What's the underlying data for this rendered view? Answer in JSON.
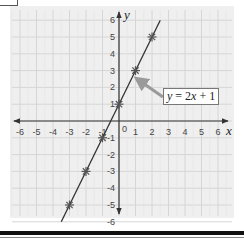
{
  "chart_data": {
    "type": "line",
    "title": "",
    "equation_label": "y = 2x + 1",
    "xlabel": "x",
    "ylabel": "y",
    "xlim": [
      -6,
      6
    ],
    "ylim": [
      -6,
      6
    ],
    "x_ticks": [
      -6,
      -5,
      -4,
      -3,
      -2,
      -1,
      0,
      1,
      2,
      3,
      4,
      5,
      6
    ],
    "y_ticks": [
      -6,
      -5,
      -4,
      -3,
      -2,
      -1,
      1,
      2,
      3,
      4,
      5,
      6
    ],
    "origin_label": "0",
    "grid": true,
    "series": [
      {
        "name": "y = 2x + 1",
        "line": {
          "x_from": -3.5,
          "x_to": 2.5,
          "slope": 2,
          "intercept": 1
        },
        "points": [
          {
            "x": -3,
            "y": -5
          },
          {
            "x": -2,
            "y": -3
          },
          {
            "x": -1,
            "y": -1
          },
          {
            "x": 0,
            "y": 1
          },
          {
            "x": 1,
            "y": 3
          },
          {
            "x": 2,
            "y": 5
          }
        ]
      }
    ],
    "annotation": {
      "text": "y = 2x + 1",
      "arrow_to": {
        "x": 1,
        "y": 2.5
      }
    }
  },
  "labels": {
    "x_axis": "x",
    "y_axis": "y",
    "eq_y": "y",
    "eq_eq": " = 2",
    "eq_x": "x",
    "eq_rest": " + 1"
  },
  "colors": {
    "panel_bg": "#efefef",
    "grid": "#d6d6d6",
    "axis": "#333333",
    "line": "#333333",
    "marker": "#555555",
    "arrow": "#9a9a9a"
  }
}
